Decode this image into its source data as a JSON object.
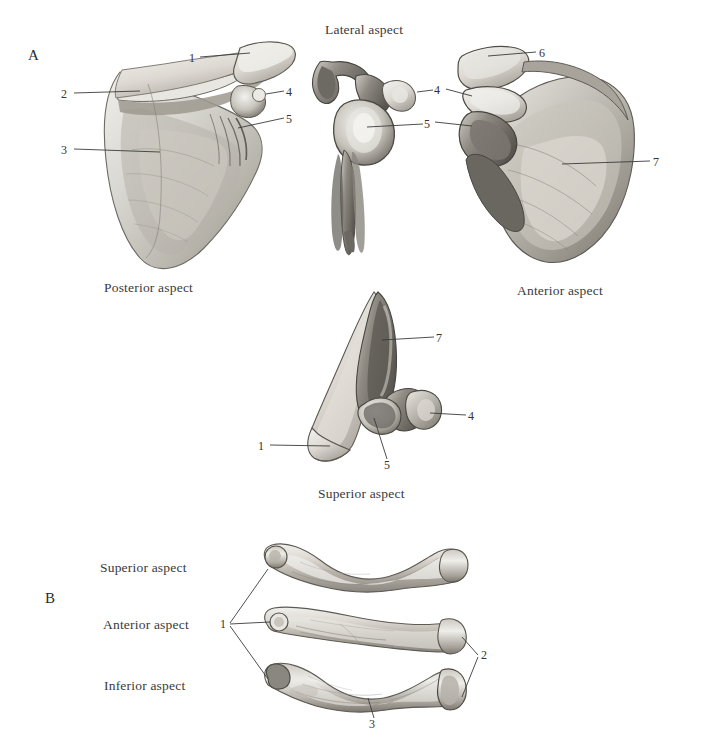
{
  "figure": {
    "background_color": "#ffffff",
    "ink_color": "#333333",
    "panels": [
      {
        "letter": "A",
        "subject": "scapula",
        "captions": [
          {
            "text": "Lateral aspect",
            "x": 325,
            "y": 33
          },
          {
            "text": "Posterior aspect",
            "x": 104,
            "y": 291
          },
          {
            "text": "Anterior aspect",
            "x": 517,
            "y": 293
          },
          {
            "text": "Superior aspect",
            "x": 318,
            "y": 496
          }
        ],
        "leader_labels": [
          {
            "id": "posterior-1",
            "text": "1",
            "x": 192,
            "y": 60,
            "view": "posterior-aspect"
          },
          {
            "id": "posterior-2",
            "text": "2",
            "x": 64,
            "y": 96,
            "view": "posterior-aspect"
          },
          {
            "id": "posterior-3",
            "text": "3",
            "x": 64,
            "y": 152,
            "view": "posterior-aspect"
          },
          {
            "id": "posterior-4",
            "text": "4",
            "x": 288,
            "y": 94,
            "view": "posterior-aspect"
          },
          {
            "id": "posterior-5",
            "text": "5",
            "x": 288,
            "y": 121,
            "view": "posterior-aspect"
          },
          {
            "id": "lateral-4",
            "text": "4",
            "x": 437,
            "y": 92,
            "view": "lateral-aspect"
          },
          {
            "id": "lateral-5",
            "text": "5",
            "x": 427,
            "y": 126,
            "view": "lateral-aspect"
          },
          {
            "id": "anterior-6",
            "text": "6",
            "x": 542,
            "y": 55,
            "view": "anterior-aspect"
          },
          {
            "id": "anterior-7",
            "text": "7",
            "x": 655,
            "y": 164,
            "view": "anterior-aspect"
          },
          {
            "id": "superior-7",
            "text": "7",
            "x": 438,
            "y": 340,
            "view": "superior-aspect"
          },
          {
            "id": "superior-4",
            "text": "4",
            "x": 470,
            "y": 418,
            "view": "superior-aspect"
          },
          {
            "id": "superior-5",
            "text": "5",
            "x": 389,
            "y": 466,
            "view": "superior-aspect"
          },
          {
            "id": "superior-1",
            "text": "1",
            "x": 261,
            "y": 448,
            "view": "superior-aspect"
          }
        ]
      },
      {
        "letter": "B",
        "subject": "clavicle",
        "captions": [
          {
            "text": "Superior aspect",
            "x": 100,
            "y": 571
          },
          {
            "text": "Anterior aspect",
            "x": 103,
            "y": 627
          },
          {
            "text": "Inferior aspect",
            "x": 104,
            "y": 688
          }
        ],
        "leader_labels": [
          {
            "id": "clavicle-1",
            "text": "1",
            "x": 222,
            "y": 626,
            "view": "all-three"
          },
          {
            "id": "clavicle-2",
            "text": "2",
            "x": 483,
            "y": 657,
            "view": "anterior-and-inferior"
          },
          {
            "id": "clavicle-3",
            "text": "3",
            "x": 371,
            "y": 726,
            "view": "inferior-aspect"
          }
        ]
      }
    ]
  }
}
